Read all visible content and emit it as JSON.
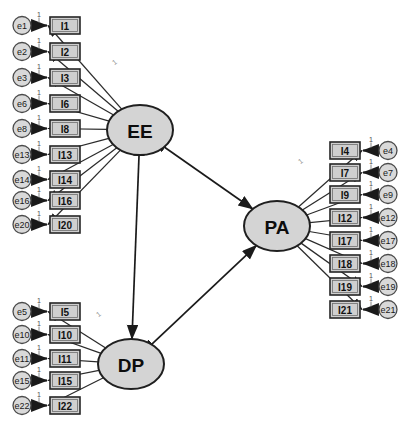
{
  "diagram": {
    "type": "sem-path-diagram",
    "fixed_loading_label": "1",
    "colors": {
      "indicator_fill": "#cfcfcf",
      "error_fill": "#d9d9d9",
      "factor_fill": "#d4d4d4",
      "stroke": "#1a1a1a",
      "background": "#ffffff"
    }
  },
  "factors": [
    {
      "id": "EE",
      "label": "EE",
      "cx": 140,
      "cy": 130,
      "rx": 33,
      "ry": 25
    },
    {
      "id": "PA",
      "label": "PA",
      "cx": 277,
      "cy": 226,
      "rx": 33,
      "ry": 25
    },
    {
      "id": "DP",
      "label": "DP",
      "cx": 131,
      "cy": 364,
      "rx": 33,
      "ry": 25
    }
  ],
  "ee_block": {
    "factor": "EE",
    "side": "left",
    "error_cx": 22,
    "box_x": 50,
    "box_w": 30,
    "box_h": 17,
    "indicators": [
      {
        "indicator": "I1",
        "error": "e1",
        "y": 17
      },
      {
        "indicator": "I2",
        "error": "e2",
        "y": 43
      },
      {
        "indicator": "I3",
        "error": "e3",
        "y": 69
      },
      {
        "indicator": "I6",
        "error": "e6",
        "y": 95
      },
      {
        "indicator": "I8",
        "error": "e8",
        "y": 120
      },
      {
        "indicator": "I13",
        "error": "e13",
        "y": 146
      },
      {
        "indicator": "I14",
        "error": "e14",
        "y": 171
      },
      {
        "indicator": "I16",
        "error": "e16",
        "y": 192
      },
      {
        "indicator": "I20",
        "error": "e20",
        "y": 216
      }
    ]
  },
  "dp_block": {
    "factor": "DP",
    "side": "left",
    "error_cx": 22,
    "box_x": 50,
    "box_w": 30,
    "box_h": 17,
    "indicators": [
      {
        "indicator": "I5",
        "error": "e5",
        "y": 303
      },
      {
        "indicator": "I10",
        "error": "e10",
        "y": 326
      },
      {
        "indicator": "I11",
        "error": "e11",
        "y": 350
      },
      {
        "indicator": "I15",
        "error": "e15",
        "y": 372
      },
      {
        "indicator": "I22",
        "error": "e22",
        "y": 397
      }
    ]
  },
  "pa_block": {
    "factor": "PA",
    "side": "right",
    "error_cx": 388,
    "box_x": 330,
    "box_w": 30,
    "box_h": 17,
    "indicators": [
      {
        "indicator": "I4",
        "error": "e4",
        "y": 142
      },
      {
        "indicator": "I7",
        "error": "e7",
        "y": 164
      },
      {
        "indicator": "I9",
        "error": "e9",
        "y": 186
      },
      {
        "indicator": "I12",
        "error": "e12",
        "y": 209
      },
      {
        "indicator": "I17",
        "error": "e17",
        "y": 232
      },
      {
        "indicator": "I18",
        "error": "e18",
        "y": 255
      },
      {
        "indicator": "I19",
        "error": "e19",
        "y": 278
      },
      {
        "indicator": "I21",
        "error": "e21",
        "y": 301
      }
    ]
  },
  "correlations": [
    {
      "from": "EE",
      "to": "PA",
      "arrow": "double"
    },
    {
      "from": "EE",
      "to": "DP",
      "arrow": "double"
    },
    {
      "from": "DP",
      "to": "PA",
      "arrow": "double"
    }
  ],
  "loading_markers": [
    {
      "factor": "EE",
      "x": 116,
      "y": 64
    },
    {
      "factor": "PA",
      "x": 302,
      "y": 163
    },
    {
      "factor": "DP",
      "x": 100,
      "y": 316
    }
  ]
}
